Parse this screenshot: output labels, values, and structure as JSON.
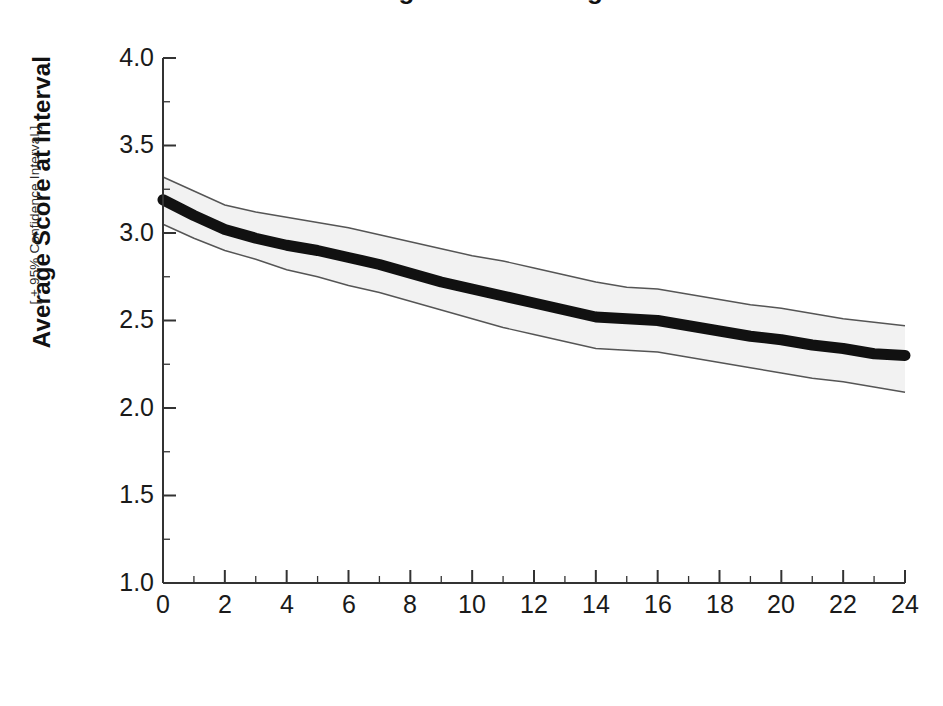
{
  "figure": {
    "title_remnant": "Average Score Change",
    "background_color": "#ffffff",
    "line_color": "#111111",
    "band_fill_color": "#f2f2f2",
    "band_edge_color": "#555555",
    "axis_color": "#333333"
  },
  "axes": {
    "x_title": "Months Post Entry",
    "y_title_main": "Average Score at Interval",
    "y_title_sub": "[ ± 95% Confidence Interval ]",
    "y_tick_labels": [
      "4.0",
      "3.5",
      "3.0",
      "2.5",
      "2.0",
      "1.5",
      "1.0"
    ],
    "x_tick_labels": [
      "0",
      "2",
      "4",
      "6",
      "8",
      "10",
      "12",
      "14",
      "16",
      "18",
      "20",
      "22",
      "24"
    ]
  },
  "chart_data": {
    "type": "line",
    "title": "Average Score Change",
    "xlabel": "Months Post Entry",
    "ylabel": "Average Score at Interval [ ± 95% Confidence Interval ]",
    "xlim": [
      0,
      24
    ],
    "ylim": [
      1.0,
      4.0
    ],
    "xticks": [
      0,
      2,
      4,
      6,
      8,
      10,
      12,
      14,
      16,
      18,
      20,
      22,
      24
    ],
    "xminor_tick_step": 1,
    "yticks": [
      1.0,
      1.5,
      2.0,
      2.5,
      3.0,
      3.5,
      4.0
    ],
    "yminor_tick_step": 0.25,
    "grid": false,
    "legend": "none",
    "x": [
      0,
      1,
      2,
      3,
      4,
      5,
      6,
      7,
      8,
      9,
      10,
      11,
      12,
      13,
      14,
      15,
      16,
      17,
      18,
      19,
      20,
      21,
      22,
      23,
      24
    ],
    "series": [
      {
        "name": "Average Score",
        "style": "thick-black-line",
        "values": [
          3.19,
          3.1,
          3.02,
          2.97,
          2.93,
          2.9,
          2.86,
          2.82,
          2.77,
          2.72,
          2.68,
          2.64,
          2.6,
          2.56,
          2.52,
          2.51,
          2.5,
          2.47,
          2.44,
          2.41,
          2.39,
          2.36,
          2.34,
          2.31,
          2.3
        ]
      },
      {
        "name": "Upper 95% Confidence Limit",
        "style": "band-edge",
        "values": [
          3.32,
          3.24,
          3.16,
          3.12,
          3.09,
          3.06,
          3.03,
          2.99,
          2.95,
          2.91,
          2.87,
          2.84,
          2.8,
          2.76,
          2.72,
          2.69,
          2.68,
          2.65,
          2.62,
          2.59,
          2.57,
          2.54,
          2.51,
          2.49,
          2.47
        ]
      },
      {
        "name": "Lower 95% Confidence Limit",
        "style": "band-edge",
        "values": [
          3.05,
          2.97,
          2.9,
          2.85,
          2.79,
          2.75,
          2.7,
          2.66,
          2.61,
          2.56,
          2.51,
          2.46,
          2.42,
          2.38,
          2.34,
          2.33,
          2.32,
          2.29,
          2.26,
          2.23,
          2.2,
          2.17,
          2.15,
          2.12,
          2.09
        ]
      }
    ]
  }
}
